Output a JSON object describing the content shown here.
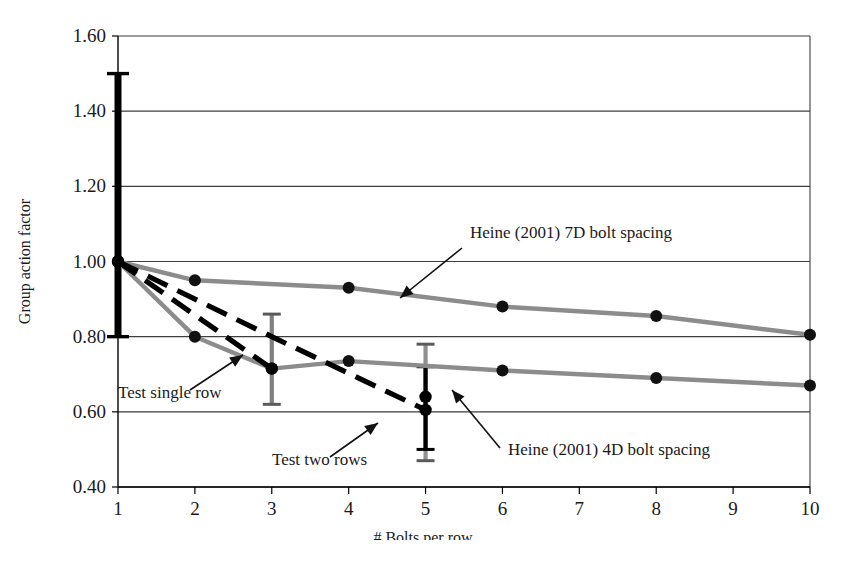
{
  "chart_data": {
    "type": "line",
    "title": "",
    "xlabel": "# Bolts per row",
    "ylabel": "Group action factor",
    "xlim": [
      1,
      10
    ],
    "ylim": [
      0.4,
      1.6
    ],
    "grid": true,
    "grid_axis": "y",
    "legend_position": "inline-annotations",
    "x_ticks": [
      "1",
      "2",
      "3",
      "4",
      "5",
      "6",
      "7",
      "8",
      "9",
      "10"
    ],
    "y_ticks": [
      "0.40",
      "0.60",
      "0.80",
      "1.00",
      "1.20",
      "1.40",
      "1.60"
    ],
    "series": [
      {
        "name": "Heine (2001) 7D bolt spacing",
        "style": "solid",
        "color": "#8c8c8c",
        "marker": "circle",
        "x": [
          1,
          2,
          4,
          6,
          8,
          10
        ],
        "values": [
          1.0,
          0.95,
          0.93,
          0.88,
          0.855,
          0.805
        ]
      },
      {
        "name": "Heine (2001) 4D bolt spacing",
        "style": "solid",
        "color": "#8c8c8c",
        "marker": "circle",
        "x": [
          1,
          2,
          3,
          4,
          6,
          8,
          10
        ],
        "values": [
          1.0,
          0.8,
          0.715,
          0.735,
          0.71,
          0.69,
          0.67
        ]
      },
      {
        "name": "Test single row",
        "style": "dashed",
        "color": "#000000",
        "marker": "none",
        "x": [
          1,
          3
        ],
        "values": [
          1.0,
          0.715
        ]
      },
      {
        "name": "Test two rows",
        "style": "dashed",
        "color": "#000000",
        "marker": "none",
        "x": [
          1,
          3,
          5
        ],
        "values": [
          1.0,
          0.8,
          0.605
        ]
      }
    ],
    "error_bars": [
      {
        "name": "error-bar-x1",
        "x": 1,
        "low": 0.8,
        "high": 1.5,
        "color": "#000000",
        "width": "thick"
      },
      {
        "name": "error-bar-x3",
        "x": 3,
        "low": 0.62,
        "high": 0.86,
        "color": "#808080",
        "width": "medium"
      },
      {
        "name": "error-bar-x5-gray",
        "x": 5,
        "low": 0.47,
        "high": 0.78,
        "color": "#909090",
        "width": "medium"
      },
      {
        "name": "error-bar-x5-black",
        "x": 5,
        "low": 0.5,
        "high": 0.72,
        "color": "#000000",
        "width": "medium"
      }
    ],
    "markers_black": [
      {
        "x": 1,
        "y": 1.0
      },
      {
        "x": 3,
        "y": 0.715
      },
      {
        "x": 5,
        "y": 0.605
      },
      {
        "x": 5,
        "y": 0.64
      }
    ],
    "annotations": [
      {
        "name": "annotation-heine-7d",
        "text": "Heine (2001) 7D bolt spacing",
        "x_px": 470,
        "y_px": 238,
        "arrow_from": [
          462,
          248
        ],
        "arrow_to": [
          400,
          298
        ]
      },
      {
        "name": "annotation-heine-4d",
        "text": "Heine (2001) 4D bolt spacing",
        "x_px": 508,
        "y_px": 455,
        "arrow_from": [
          500,
          448
        ],
        "arrow_to": [
          452,
          390
        ]
      },
      {
        "name": "annotation-test-single-row",
        "text": "Test single row",
        "x_px": 118,
        "y_px": 398,
        "arrow_from": [
          190,
          390
        ],
        "arrow_to": [
          243,
          355
        ]
      },
      {
        "name": "annotation-test-two-rows",
        "text": "Test two rows",
        "x_px": 272,
        "y_px": 465,
        "arrow_from": [
          330,
          457
        ],
        "arrow_to": [
          378,
          423
        ]
      }
    ]
  }
}
